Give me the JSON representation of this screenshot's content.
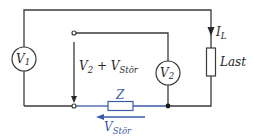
{
  "diagram": {
    "type": "circuit",
    "colors": {
      "wire": "#3a3a3a",
      "interference": "#3b5ba8"
    },
    "voltmeter_1": {
      "symbol": "V",
      "subscript": "1"
    },
    "voltmeter_2": {
      "symbol": "V",
      "subscript": "2"
    },
    "measured_voltage": {
      "prefix": "V",
      "sub1": "2",
      "plus": " + V",
      "sub2": "Stör"
    },
    "load_current": {
      "symbol": "I",
      "subscript": "L"
    },
    "load": {
      "label": "Last"
    },
    "impedance": {
      "label": "Z"
    },
    "interference_voltage": {
      "symbol": "V",
      "subscript": "Stör"
    }
  }
}
